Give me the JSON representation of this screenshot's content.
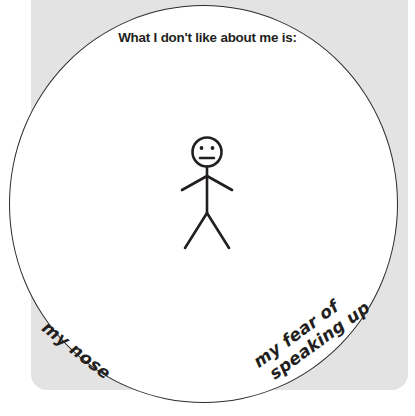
{
  "worksheet": {
    "prompt": "What I don't like about me is:",
    "colors": {
      "card_background": "#e3e3e3",
      "circle_fill": "#ffffff",
      "ink": "#231f20",
      "page_background": "#ffffff"
    },
    "figure": {
      "name": "stick-figure",
      "expression": "neutral",
      "eyes": 2,
      "mouth": "straight-line"
    },
    "answers": [
      {
        "id": "answer-left",
        "text": "my nose",
        "position": "bottom-left",
        "rotation_deg": 38
      },
      {
        "id": "answer-right",
        "line1": "my fear of",
        "line2": "speaking up",
        "text": "my fear of speaking up",
        "position": "bottom-right",
        "rotation_deg": -36
      }
    ]
  }
}
